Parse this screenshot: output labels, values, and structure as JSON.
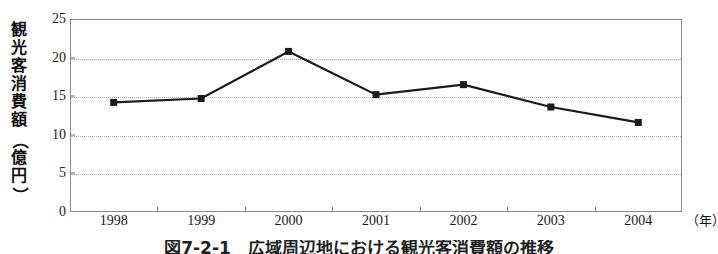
{
  "figure": {
    "caption": "図7-2-1　広域周辺地における観光客消費額の推移"
  },
  "chart_data": {
    "type": "line",
    "title": "",
    "xlabel": "（年）",
    "ylabel": "観光客消費額（億円）",
    "ylabel_chars": [
      "観",
      "光",
      "客",
      "消",
      "費",
      "額"
    ],
    "ylabel_unit_open": "（",
    "ylabel_unit_chars": [
      "億",
      "円"
    ],
    "ylabel_unit_close": "）",
    "categories": [
      "1998",
      "1999",
      "2000",
      "2001",
      "2002",
      "2003",
      "2004"
    ],
    "values": [
      14.2,
      14.7,
      20.8,
      15.2,
      16.5,
      13.6,
      11.6
    ],
    "yticks": [
      "0",
      "5",
      "10",
      "15",
      "20",
      "25"
    ],
    "ytick_values": [
      0,
      5,
      10,
      15,
      20,
      25
    ],
    "ylim": [
      0,
      25
    ],
    "grid": true,
    "legend": "none",
    "marker": "filled-square",
    "series_color": "#1a1a1a",
    "grid_color": "#b0b0b0",
    "frame_color": "#8a8a8a",
    "background_color": "#ffffff"
  }
}
